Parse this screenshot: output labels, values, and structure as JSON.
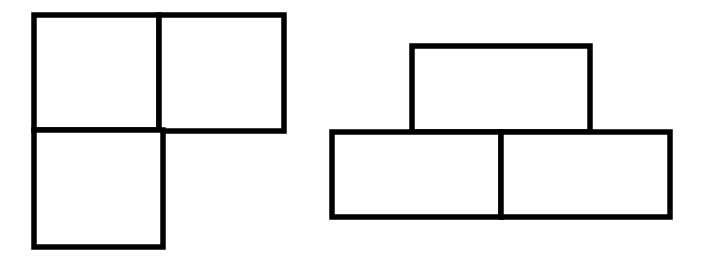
{
  "page": {
    "title": "Tromino Shape Comparison",
    "width": 702,
    "height": 275,
    "background_color": "#fefefe",
    "stroke_color": "#000000",
    "fill_color": "#ffffff",
    "stroke_width": 5.5
  },
  "figures": [
    {
      "id": "left-figure",
      "name": "L-tromino",
      "label": "L-shaped figure made of three squares",
      "cells": [
        {
          "id": "left-cell-top-left",
          "label": "top-left square",
          "x": 34,
          "y": 15,
          "width": 125,
          "height": 115
        },
        {
          "id": "left-cell-top-right",
          "label": "top-right square",
          "x": 159,
          "y": 15,
          "width": 125,
          "height": 116
        },
        {
          "id": "left-cell-bottom-left",
          "label": "bottom-left square",
          "x": 34,
          "y": 130,
          "width": 129,
          "height": 117
        }
      ]
    },
    {
      "id": "right-figure",
      "name": "T-tromino",
      "label": "T-shaped figure made of three rectangles",
      "cells": [
        {
          "id": "right-cell-top",
          "label": "top rectangle",
          "x": 412,
          "y": 46,
          "width": 178,
          "height": 86
        },
        {
          "id": "right-cell-bottom-left",
          "label": "bottom-left rectangle",
          "x": 332,
          "y": 132,
          "width": 169,
          "height": 85
        },
        {
          "id": "right-cell-bottom-right",
          "label": "bottom-right rectangle",
          "x": 501,
          "y": 132,
          "width": 169,
          "height": 85
        }
      ]
    }
  ],
  "chart_data": {
    "type": "diagram",
    "title": "Tromino Shape Comparison",
    "shape_count": 2,
    "total_cells": 6,
    "shapes": [
      {
        "name": "L-tromino",
        "cell_count": 3,
        "arrangement": "two squares on top row, one square below the left square"
      },
      {
        "name": "T-tromino",
        "cell_count": 3,
        "arrangement": "two rectangles on bottom row, one rectangle centered above"
      }
    ]
  }
}
